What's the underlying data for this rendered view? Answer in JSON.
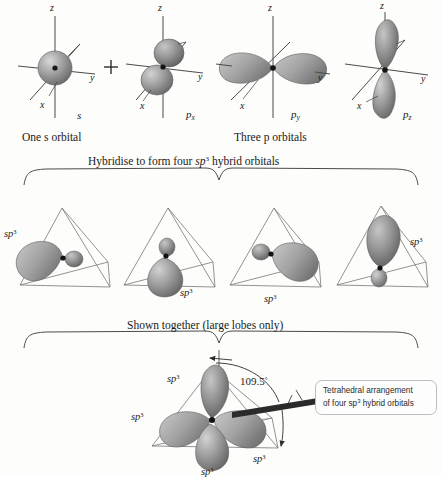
{
  "figure": {
    "background_color": "#fdfdfb",
    "orbital_fill": "#9a9a9a",
    "axis_color": "#3a3a3a",
    "callout_border_color": "#b9bdc2"
  },
  "row_top": {
    "caption_left": "One s orbital",
    "caption_right": "Three p orbitals",
    "plus_sign": "+",
    "orbitals": [
      {
        "name": "s",
        "label_base": "s",
        "label_sub": "",
        "type": "sphere",
        "axes": [
          "z",
          "y",
          "x"
        ]
      },
      {
        "name": "px",
        "label_base": "p",
        "label_sub": "x",
        "type": "dumbbell-x",
        "axes": [
          "z",
          "y",
          "x"
        ]
      },
      {
        "name": "py",
        "label_base": "p",
        "label_sub": "y",
        "type": "dumbbell-y",
        "axes": [
          "z",
          "y",
          "x"
        ]
      },
      {
        "name": "pz",
        "label_base": "p",
        "label_sub": "z",
        "type": "dumbbell-z",
        "axes": [
          "z",
          "y",
          "x"
        ]
      }
    ]
  },
  "brace_hybridise": {
    "text_a": "Hybridise to form four ",
    "text_sp": "sp",
    "text_sup": "3",
    "text_b": " hybrid orbitals"
  },
  "row_middle": {
    "tetrahedra": [
      {
        "name": "hybrid-orbital-1",
        "lobe_direction": "left",
        "label": "sp",
        "label_sup": "3",
        "label_pos": "upper-left"
      },
      {
        "name": "hybrid-orbital-2",
        "lobe_direction": "down",
        "label": "sp",
        "label_sup": "3",
        "label_pos": "lower-right"
      },
      {
        "name": "hybrid-orbital-3",
        "lobe_direction": "right",
        "label": "sp",
        "label_sup": "3",
        "label_pos": "lower-right"
      },
      {
        "name": "hybrid-orbital-4",
        "lobe_direction": "up",
        "label": "sp",
        "label_sup": "3",
        "label_pos": "upper-right"
      }
    ]
  },
  "brace_shown_together": {
    "text": "Shown together (large lobes only)"
  },
  "row_bottom": {
    "angle_label": "109.5",
    "angle_degree_symbol": "°",
    "sp3_labels": [
      {
        "id": "sp3-top-left",
        "base": "sp",
        "sup": "3"
      },
      {
        "id": "sp3-mid-left",
        "base": "sp",
        "sup": "3"
      },
      {
        "id": "sp3-bottom-right",
        "base": "sp",
        "sup": "3"
      },
      {
        "id": "sp3-bottom-center",
        "base": "sp",
        "sup": "3"
      }
    ],
    "callout": {
      "line1": "Tetrahedral arrangement",
      "line2_a": "of four sp",
      "line2_sup": "3",
      "line2_b": " hybrid orbitals"
    }
  }
}
